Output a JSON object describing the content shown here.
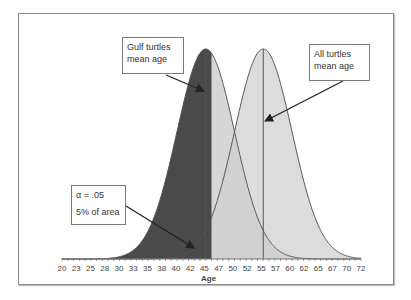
{
  "chart_data": {
    "type": "area",
    "title": "",
    "xlabel": "Age",
    "ylabel": "",
    "xlim": [
      20,
      72
    ],
    "x_ticks": [
      20,
      23,
      25,
      28,
      30,
      33,
      35,
      38,
      40,
      42,
      45,
      47,
      50,
      52,
      55,
      57,
      60,
      62,
      65,
      67,
      70,
      72
    ],
    "grid": false,
    "series": [
      {
        "name": "Gulf turtles",
        "distribution": "normal",
        "mean": 45,
        "sd": 5,
        "fill": "#cfcfcf"
      },
      {
        "name": "All turtles",
        "distribution": "normal",
        "mean": 55,
        "sd": 5,
        "fill": "#d6d6d6"
      }
    ],
    "critical_region": {
      "series": "Gulf turtles",
      "from": 20,
      "to": 46,
      "alpha": 0.05,
      "fill": "#4a4a4a"
    },
    "mean_lines": [
      45,
      55
    ],
    "annotations": [
      {
        "id": "gulf",
        "lines": [
          "Gulf turtles",
          "mean age"
        ],
        "points_to": 45
      },
      {
        "id": "all",
        "lines": [
          "All turtles",
          "mean age"
        ],
        "points_to": 55
      },
      {
        "id": "alpha",
        "lines": [
          "α = .05",
          "5% of area"
        ],
        "points_to": 42
      }
    ]
  },
  "labels": {
    "gulf_1": "Gulf turtles",
    "gulf_2": "mean age",
    "all_1": "All turtles",
    "all_2": "mean age",
    "alpha_1": "α = .05",
    "alpha_2": "5% of area"
  }
}
